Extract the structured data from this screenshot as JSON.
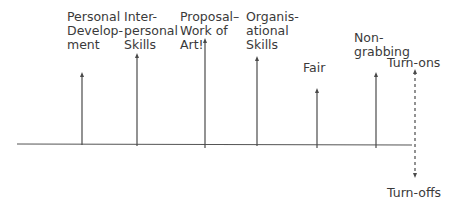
{
  "diagram": {
    "type": "force-field",
    "baseline": {
      "x1": 17,
      "x2": 412,
      "y": 144,
      "color": "#555555"
    },
    "axis": {
      "x": 415,
      "top_y": 69,
      "bottom_y": 178,
      "style": "dashed",
      "top_label": "Turn-ons",
      "bottom_label": "Turn-offs"
    },
    "forces": [
      {
        "id": "personal-development",
        "label": "Personal\nDevelop-\nment",
        "x": 82,
        "tip_y": 72,
        "bottom_y": 145,
        "label_x": 67,
        "label_y": 10
      },
      {
        "id": "interpersonal-skills",
        "label": "Inter-\npersonal\nSkills",
        "x": 137,
        "tip_y": 53,
        "bottom_y": 146,
        "label_x": 124,
        "label_y": 10
      },
      {
        "id": "proposal-work-of-art",
        "label": "Proposal–\nWork of\nArt!",
        "x": 205,
        "tip_y": 38,
        "bottom_y": 148,
        "label_x": 180,
        "label_y": 10
      },
      {
        "id": "organisational-skills",
        "label": "Organis-\national\nSkills",
        "x": 257,
        "tip_y": 56,
        "bottom_y": 146,
        "label_x": 246,
        "label_y": 10
      },
      {
        "id": "fair",
        "label": "Fair",
        "x": 317,
        "tip_y": 88,
        "bottom_y": 148,
        "label_x": 303,
        "label_y": 61
      },
      {
        "id": "non-grabbing",
        "label": "Non-\ngrabbing",
        "x": 376,
        "tip_y": 72,
        "bottom_y": 148,
        "label_x": 354,
        "label_y": 31
      }
    ],
    "turn_ons_label_pos": {
      "x": 387,
      "y": 56
    },
    "turn_offs_label_pos": {
      "x": 387,
      "y": 186
    },
    "colors": {
      "line": "#4a4a4a",
      "text": "#3a3a3a",
      "background": "#ffffff"
    }
  }
}
